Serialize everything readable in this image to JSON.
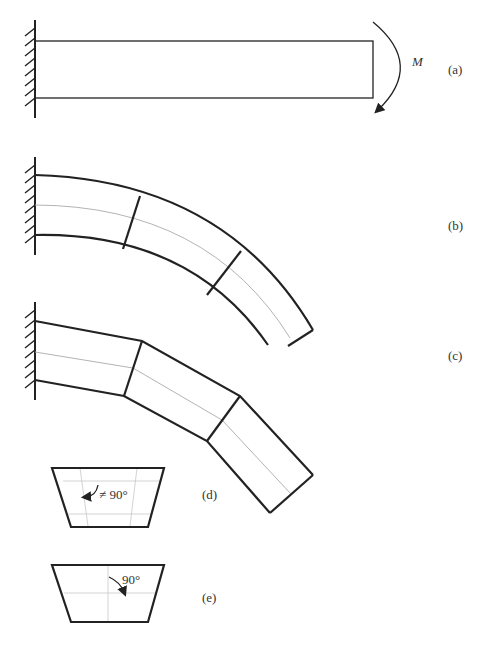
{
  "figure": {
    "panels": [
      {
        "id": "a",
        "label": "(a)",
        "description": "Cantilever beam, fixed at left wall, moment M applied at free end"
      },
      {
        "id": "b",
        "label": "(b)",
        "description": "Beam bent into a circular arc; plane sections remain plane and normal to neutral axis"
      },
      {
        "id": "c",
        "label": "(c)",
        "description": "Segmented deformation with kinks; sections not normal"
      },
      {
        "id": "d",
        "label": "(d)",
        "description": "Element with distorted grid; angle not 90 degrees"
      },
      {
        "id": "e",
        "label": "(e)",
        "description": "Element with grid lines remaining perpendicular; angle 90 degrees"
      }
    ],
    "moment_label": "M",
    "angle_not_right": "≠ 90°",
    "angle_right": "90°"
  }
}
